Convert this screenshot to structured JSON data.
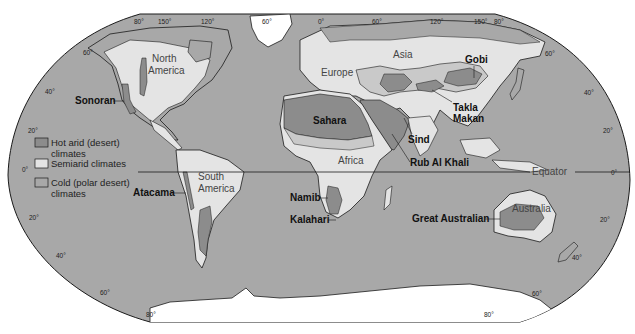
{
  "colors": {
    "ocean": "#a8a8a8",
    "land_other": "#a8a8a8",
    "semiarid": "#e4e4e4",
    "hot_arid": "#8c8c8c",
    "polar_ice": "#ffffff",
    "outline": "#1a1a1a"
  },
  "legend": {
    "items": [
      {
        "key": "hot_arid",
        "line1": "Hot arid (desert)",
        "line2": "climates"
      },
      {
        "key": "semiarid",
        "line1": "Semiarid climates",
        "line2": ""
      },
      {
        "key": "cold",
        "line1": "Cold (polar desert)",
        "line2": "climates"
      }
    ]
  },
  "continents": {
    "north_america": [
      "North",
      "America"
    ],
    "south_america": [
      "South",
      "America"
    ],
    "europe": "Europe",
    "asia": "Asia",
    "africa": "Africa",
    "australia": "Australia"
  },
  "deserts": {
    "sonoran": "Sonoran",
    "atacama": "Atacama",
    "sahara": "Sahara",
    "namib": "Namib",
    "kalahari": "Kalahari",
    "sind": "Sind",
    "rub_al_khali": "Rub Al Khali",
    "gobi": "Gobi",
    "takla_makan": [
      "Takla",
      "Makan"
    ],
    "great_australian": "Great Australian"
  },
  "equator_label": "Equator",
  "graticule": {
    "top_longitudes": [
      "80°",
      "150°",
      "120°",
      "60°",
      "0°",
      "60°",
      "120°",
      "150°",
      "80°"
    ],
    "left_latitudes": [
      "60°",
      "40°",
      "20°",
      "0°",
      "20°",
      "40°",
      "60°",
      "80°"
    ],
    "right_latitudes": [
      "60°",
      "40°",
      "20°",
      "0°",
      "20°",
      "40°",
      "60°",
      "80°"
    ]
  }
}
